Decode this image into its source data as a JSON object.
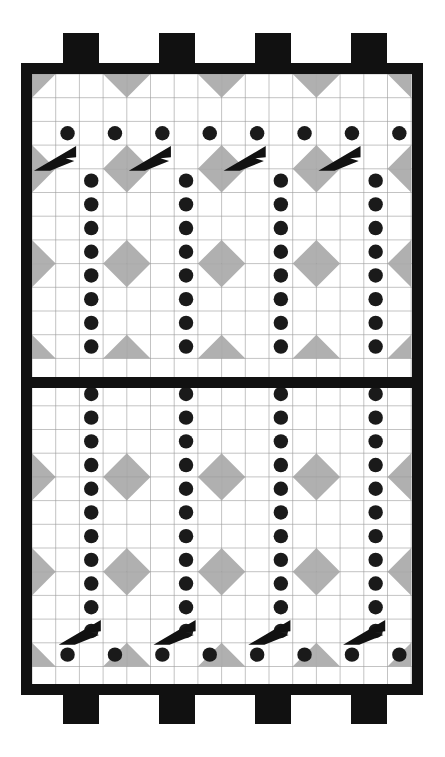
{
  "artwork": {
    "title": "Quilt Block Pattern Diagram",
    "canvas": {
      "width": 445,
      "height": 757,
      "background": "#ffffff"
    },
    "palette": {
      "frame": "#111111",
      "gray": "#b0b0b0",
      "white": "#ffffff",
      "gridline": "#9a9a9a",
      "dot": "#1a1a1a",
      "dart": "#111111"
    },
    "frame": {
      "outer_x": 21,
      "outer_y": 63,
      "outer_width": 402,
      "outer_height": 632,
      "thickness": 11,
      "mid_divider_y": 377,
      "mid_divider_height": 11
    },
    "tabs": {
      "label": "crenellation-tabs",
      "count_top": 4,
      "count_bottom": 4,
      "width": 36,
      "height": 30,
      "top_y": 33,
      "bottom_y": 694,
      "x_positions": [
        63,
        159,
        255,
        351
      ]
    },
    "grid": {
      "origin_x": 32,
      "origin_y": 74,
      "cell": 23.7,
      "columns": 16,
      "rows": 26,
      "line_color": "#9a9a9a",
      "line_width": 0.6
    },
    "dots": {
      "radius": 7.2,
      "color": "#1a1a1a",
      "top_row_count": 8,
      "bottom_row_count": 8,
      "vertical_column_count": 4
    },
    "darts": {
      "top_count": 4,
      "bottom_count": 4,
      "direction_top": "up-right",
      "direction_bottom": "up-right",
      "color": "#111111"
    },
    "panels": [
      {
        "name": "upper-panel",
        "rows": 13
      },
      {
        "name": "lower-panel",
        "rows": 13
      }
    ]
  },
  "chart_data": {
    "type": "diagram",
    "title": "Quilt Block Pattern Diagram",
    "motifs": [
      {
        "name": "gray-half-square-triangle",
        "color": "#b0b0b0",
        "count": 92
      },
      {
        "name": "black-dot",
        "color": "#1a1a1a",
        "count": 76
      },
      {
        "name": "black-dart",
        "color": "#111111",
        "count": 8
      }
    ]
  }
}
